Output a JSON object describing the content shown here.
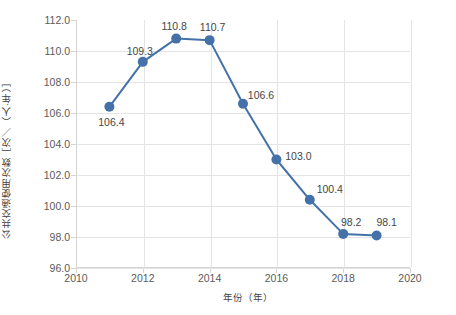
{
  "chart_data": {
    "type": "line",
    "title": "",
    "xlabel": "年份（年）",
    "ylabel": "公共交通使用次数［次／（人·年）］",
    "x": [
      2011,
      2012,
      2013,
      2014,
      2015,
      2016,
      2017,
      2018,
      2019
    ],
    "values": [
      106.4,
      109.3,
      110.8,
      110.7,
      106.6,
      103.0,
      100.4,
      98.2,
      98.1
    ],
    "point_labels": [
      "106.4",
      "109.3",
      "110.8",
      "110.7",
      "106.6",
      "103.0",
      "100.4",
      "98.2",
      "98.1"
    ],
    "xlim": [
      2010,
      2020
    ],
    "ylim": [
      96.0,
      112.0
    ],
    "xticks": [
      2010,
      2012,
      2014,
      2016,
      2018,
      2020
    ],
    "xtick_labels": [
      "2010",
      "2012",
      "2014",
      "2016",
      "2018",
      "2020"
    ],
    "yticks": [
      96.0,
      98.0,
      100.0,
      102.0,
      104.0,
      106.0,
      108.0,
      110.0,
      112.0
    ],
    "ytick_labels": [
      "96.0",
      "98.0",
      "100.0",
      "102.0",
      "104.0",
      "106.0",
      "108.0",
      "110.0",
      "112.0"
    ],
    "grid": true,
    "legend": false,
    "series_color": "#4472a8",
    "marker": "circle",
    "marker_size": 5,
    "line_width": 2
  },
  "axes": {
    "y_title": "公共交通使用次数［次／（人·年）］",
    "x_title": "年份（年）"
  },
  "colors": {
    "series": "#4472a8",
    "grid": "#e4e4e4",
    "axis": "#d4d4d4",
    "tick_text": "#5a5a5a",
    "label_text": "#464646",
    "background": "#ffffff"
  }
}
